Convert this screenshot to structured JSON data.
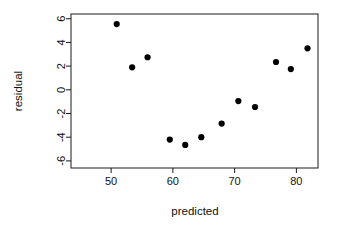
{
  "chart_data": {
    "type": "scatter",
    "title": "",
    "xlabel": "predicted",
    "ylabel": "residual",
    "xlim": [
      43.5,
      83.5
    ],
    "ylim": [
      -6.6,
      6.4
    ],
    "xticks": [
      50,
      60,
      70,
      80
    ],
    "yticks": [
      6,
      4,
      2,
      0,
      -2,
      -4,
      -6
    ],
    "xtick_labels": [
      "50",
      "60",
      "70",
      "80"
    ],
    "ytick_labels": [
      "6",
      "4",
      "2",
      "0",
      "-2",
      "-4",
      "-6"
    ],
    "grid": false,
    "legend": null,
    "point_color": "#000000",
    "point_size": 3.1,
    "box": true,
    "x": [
      50.9,
      53.4,
      55.9,
      59.5,
      62.0,
      64.6,
      67.9,
      70.6,
      73.3,
      76.7,
      79.1,
      81.8
    ],
    "y": [
      5.55,
      1.9,
      2.75,
      -4.2,
      -4.65,
      -4.0,
      -2.85,
      -0.95,
      -1.45,
      2.35,
      1.75,
      3.5
    ],
    "points": [
      {
        "x": 50.9,
        "y": 5.55
      },
      {
        "x": 53.4,
        "y": 1.9
      },
      {
        "x": 55.9,
        "y": 2.75
      },
      {
        "x": 59.5,
        "y": -4.2
      },
      {
        "x": 62.0,
        "y": -4.65
      },
      {
        "x": 64.6,
        "y": -4.0
      },
      {
        "x": 67.9,
        "y": -2.85
      },
      {
        "x": 70.6,
        "y": -0.95
      },
      {
        "x": 73.3,
        "y": -1.45
      },
      {
        "x": 76.7,
        "y": 2.35
      },
      {
        "x": 79.1,
        "y": 1.75
      },
      {
        "x": 81.8,
        "y": 3.5
      }
    ]
  }
}
